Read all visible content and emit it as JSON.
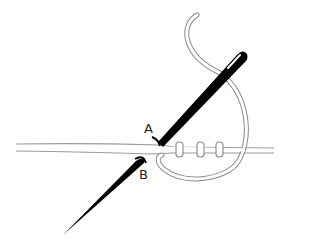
{
  "diagram": {
    "type": "embroidery-stitch-illustration",
    "labels": [
      {
        "id": "A",
        "text": "A"
      },
      {
        "id": "B",
        "text": "B"
      }
    ],
    "elements": {
      "needle_upper": "Needle emerging at point A, eye at top threaded",
      "needle_lower": "Needle tip entering fabric at point B",
      "thread_wraps_count": 3,
      "fabric": "Two parallel lines representing fabric edge"
    },
    "colors": {
      "needle": "#000000",
      "thread_outline": "#8a8a8a",
      "fabric_line": "#999999",
      "background": "#ffffff"
    }
  }
}
